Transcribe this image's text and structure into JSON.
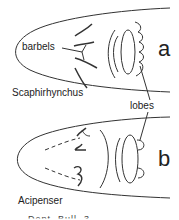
{
  "figure": {
    "panel_a": {
      "letter": "a",
      "genus": "Scaphirhynchus"
    },
    "panel_b": {
      "letter": "b",
      "genus": "Acipenser"
    },
    "labels": {
      "barbels": "barbels",
      "lobes": "lobes"
    },
    "caption_cut": "... ... Dept. Bull. 3..."
  }
}
